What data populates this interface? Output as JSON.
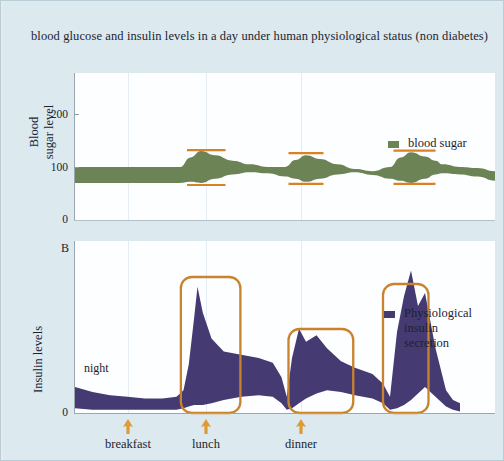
{
  "title": "blood glucose and insulin levels in a day under human physiological status (non diabetes)",
  "panel_b_letter": "B",
  "colors": {
    "background": "#dce9ef",
    "plot_background": "#fdfeff",
    "blood_sugar": "#6c8455",
    "insulin": "#463a72",
    "marker_orange": "#d98123",
    "box_orange": "#c8832c",
    "arrow_orange": "#e09a32",
    "axis": "#9aa7b0",
    "grid": "#e3edf3",
    "text": "#1b2430"
  },
  "panel_a": {
    "ylabel_line1": "Blood",
    "ylabel_line2": "sugar level",
    "yticks": [
      "0",
      "100",
      "200"
    ],
    "ytick_values": [
      0,
      100,
      200
    ],
    "legend": {
      "label": "blood sugar",
      "color": "#6c8455"
    }
  },
  "panel_b": {
    "ylabel": "Insulin levels",
    "yticks": [
      "0"
    ],
    "ytick_values": [
      0
    ],
    "night_label": "night",
    "legend": {
      "line1": "Physiological",
      "line2": "insulin",
      "line3": "secretion",
      "color": "#463a72"
    }
  },
  "meals": [
    {
      "name": "breakfast",
      "x": 127
    },
    {
      "name": "lunch",
      "x": 205
    },
    {
      "name": "dinner",
      "x": 300
    }
  ],
  "chart_data": {
    "type": "area",
    "title": "blood glucose and insulin levels in a day under human physiological status (non diabetes)",
    "grid": true,
    "legend_position": "right",
    "panels": [
      {
        "id": "A",
        "ylabel": "Blood sugar level",
        "ylim": [
          0,
          260
        ],
        "yticks": [
          0,
          100,
          200
        ],
        "xlim": [
          0,
          24
        ],
        "series": [
          {
            "name": "blood sugar",
            "type": "band",
            "color": "#6c8455",
            "x": [
              0,
              1,
              2,
              3,
              4,
              5,
              6,
              6.6,
              7.2,
              8,
              9,
              10,
              11,
              12,
              12.6,
              13.2,
              14,
              15,
              16,
              17,
              18,
              18.6,
              19.2,
              20,
              20.6,
              21,
              22,
              23,
              24
            ],
            "upper": [
              100,
              100,
              100,
              100,
              100,
              100,
              100,
              118,
              130,
              122,
              112,
              105,
              100,
              100,
              113,
              122,
              115,
              105,
              96,
              92,
              100,
              118,
              128,
              120,
              112,
              105,
              100,
              98,
              92
            ],
            "lower": [
              70,
              70,
              70,
              70,
              70,
              70,
              70,
              72,
              70,
              78,
              86,
              90,
              88,
              82,
              78,
              72,
              78,
              86,
              90,
              85,
              78,
              74,
              70,
              78,
              86,
              88,
              86,
              82,
              74
            ]
          }
        ],
        "markers": [
          {
            "meal": "breakfast",
            "x_start": 6.4,
            "x_end": 8.6,
            "upper_value": 132,
            "lower_value": 66
          },
          {
            "meal": "lunch",
            "x_start": 12.2,
            "x_end": 14.2,
            "upper_value": 126,
            "lower_value": 68
          },
          {
            "meal": "dinner",
            "x_start": 18.2,
            "x_end": 20.6,
            "upper_value": 131,
            "lower_value": 68
          }
        ]
      },
      {
        "id": "B",
        "ylabel": "Insulin levels",
        "ylim": [
          0,
          100
        ],
        "yticks": [
          0
        ],
        "xlim": [
          0,
          24
        ],
        "annotations": [
          {
            "text": "night",
            "x": 2.5,
            "y": 30
          }
        ],
        "series": [
          {
            "name": "Physiological insulin secretion",
            "type": "band",
            "color": "#463a72",
            "x": [
              0,
              1,
              2,
              3,
              4,
              5,
              5.8,
              6.2,
              6.5,
              6.8,
              7.0,
              7.3,
              7.8,
              8.5,
              9.5,
              10.5,
              11.3,
              11.8,
              12.1,
              12.4,
              12.8,
              13.2,
              13.8,
              14.4,
              15.2,
              16,
              17,
              17.6,
              18.0,
              18.4,
              18.8,
              19.2,
              19.6,
              20.0,
              20.6,
              21.2,
              21.6,
              22
            ],
            "upper": [
              16,
              13,
              11,
              10,
              9,
              9,
              10,
              14,
              30,
              58,
              78,
              62,
              46,
              38,
              36,
              34,
              31,
              22,
              10,
              34,
              52,
              44,
              48,
              40,
              32,
              28,
              24,
              18,
              10,
              50,
              72,
              88,
              66,
              74,
              40,
              14,
              8,
              6
            ],
            "lower": [
              3,
              2,
              2,
              2,
              2,
              2,
              2,
              3,
              4,
              5,
              5,
              5,
              6,
              8,
              10,
              11,
              10,
              6,
              2,
              3,
              6,
              9,
              12,
              14,
              13,
              11,
              9,
              6,
              2,
              3,
              5,
              8,
              12,
              16,
              10,
              4,
              2,
              1
            ]
          }
        ],
        "highlight_boxes": [
          {
            "meal": "breakfast",
            "x_start": 6.05,
            "x_end": 9.45
          },
          {
            "meal": "lunch",
            "x_start": 12.2,
            "x_end": 15.9
          },
          {
            "meal": "dinner",
            "x_start": 17.6,
            "x_end": 20.2
          }
        ]
      }
    ]
  }
}
